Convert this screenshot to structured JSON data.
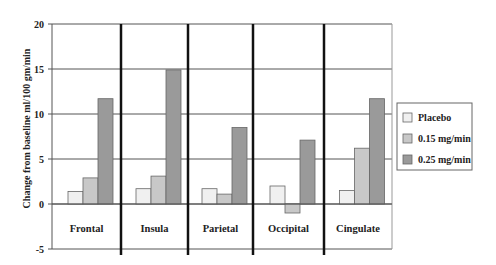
{
  "chart_data": {
    "type": "bar",
    "title": "",
    "xlabel": "",
    "ylabel": "Change from baseline ml/100 gm/min",
    "ylim": [
      -5,
      20
    ],
    "yticks": [
      -5,
      0,
      5,
      10,
      15,
      20
    ],
    "grid": true,
    "legend_position": "right",
    "categories": [
      "Frontal",
      "Insula",
      "Parietal",
      "Occipital",
      "Cingulate"
    ],
    "series": [
      {
        "name": "Placebo",
        "color": "#f0f0f0",
        "values": [
          1.4,
          1.7,
          1.7,
          2.0,
          1.5
        ]
      },
      {
        "name": "0.15 mg/min",
        "color": "#c8c8c8",
        "values": [
          2.9,
          3.1,
          1.1,
          -1.0,
          6.2
        ]
      },
      {
        "name": "0.25 mg/min",
        "color": "#9a9a9a",
        "values": [
          11.7,
          14.9,
          8.5,
          7.1,
          11.7
        ]
      }
    ]
  }
}
